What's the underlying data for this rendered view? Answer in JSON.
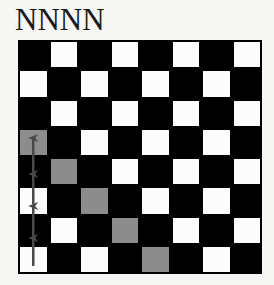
{
  "title": "NNNN",
  "board": {
    "rows": 8,
    "cols": 8,
    "top_left_color": "dark",
    "colors": {
      "dark": "#000000",
      "light": "#fcfcfc",
      "highlight": "#8c8c8c",
      "arrow": "#4a4a4a",
      "background": "#f6f6f4"
    },
    "highlighted_cells": [
      {
        "row": 3,
        "col": 0
      },
      {
        "row": 4,
        "col": 1
      },
      {
        "row": 5,
        "col": 2
      },
      {
        "row": 6,
        "col": 3
      },
      {
        "row": 7,
        "col": 4
      }
    ],
    "arrows": [
      {
        "col": 0,
        "from_row": 7,
        "to_row": 7,
        "direction": "up"
      },
      {
        "col": 0,
        "from_row": 7,
        "to_row": 6,
        "direction": "up"
      },
      {
        "col": 0,
        "from_row": 6,
        "to_row": 5,
        "direction": "up"
      },
      {
        "col": 0,
        "from_row": 5,
        "to_row": 3,
        "direction": "up"
      }
    ]
  }
}
